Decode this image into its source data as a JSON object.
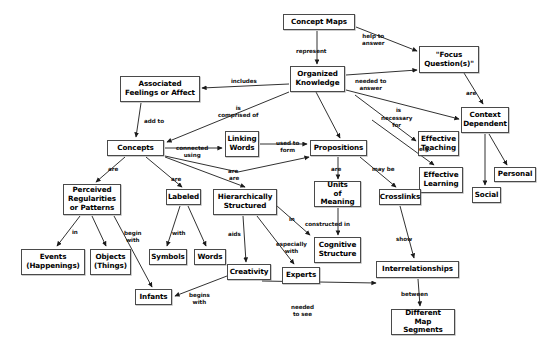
{
  "diagram": {
    "title": "Concept Maps",
    "type": "concept-map",
    "background": "#ffffff",
    "node_border_color": "#4a4a4a",
    "text_color": "#000000"
  },
  "nodes": [
    {
      "id": "concept-maps",
      "label": "Concept Maps",
      "x": 283,
      "y": 14,
      "w": 72,
      "h": 16
    },
    {
      "id": "focus-questions",
      "label": "\"Focus\nQuestion(s)\"",
      "x": 419,
      "y": 46,
      "w": 60,
      "h": 27
    },
    {
      "id": "organized-knowledge",
      "label": "Organized\nKnowledge",
      "x": 290,
      "y": 66,
      "w": 55,
      "h": 26
    },
    {
      "id": "associated-feelings",
      "label": "Associated\nFeelings or Affect",
      "x": 120,
      "y": 76,
      "w": 80,
      "h": 26
    },
    {
      "id": "context-dependent",
      "label": "Context\nDependent",
      "x": 461,
      "y": 107,
      "w": 48,
      "h": 26
    },
    {
      "id": "concepts",
      "label": "Concepts",
      "x": 107,
      "y": 140,
      "w": 57,
      "h": 16
    },
    {
      "id": "linking-words",
      "label": "Linking\nWords",
      "x": 225,
      "y": 131,
      "w": 34,
      "h": 26
    },
    {
      "id": "propositions",
      "label": "Propositions",
      "x": 310,
      "y": 140,
      "w": 57,
      "h": 16
    },
    {
      "id": "effective-teaching",
      "label": "Effective\nTeaching",
      "x": 418,
      "y": 131,
      "w": 41,
      "h": 25
    },
    {
      "id": "effective-learning",
      "label": "Effective\nLearning",
      "x": 419,
      "y": 167,
      "w": 44,
      "h": 26
    },
    {
      "id": "personal",
      "label": "Personal",
      "x": 494,
      "y": 167,
      "w": 42,
      "h": 15
    },
    {
      "id": "social",
      "label": "Social",
      "x": 472,
      "y": 187,
      "w": 29,
      "h": 16
    },
    {
      "id": "perceived-regularities",
      "label": "Perceived\nRegularities\nor Patterns",
      "x": 63,
      "y": 184,
      "w": 58,
      "h": 31
    },
    {
      "id": "labeled",
      "label": "Labeled",
      "x": 166,
      "y": 189,
      "w": 35,
      "h": 16
    },
    {
      "id": "hierarchically-structured",
      "label": "Hierarchically\nStructured",
      "x": 213,
      "y": 189,
      "w": 64,
      "h": 26
    },
    {
      "id": "units-of-meaning",
      "label": "Units\nof Meaning",
      "x": 314,
      "y": 181,
      "w": 47,
      "h": 26
    },
    {
      "id": "crosslinks",
      "label": "Crosslinks",
      "x": 379,
      "y": 189,
      "w": 42,
      "h": 16
    },
    {
      "id": "events",
      "label": "Events\n(Happenings)",
      "x": 21,
      "y": 249,
      "w": 64,
      "h": 26
    },
    {
      "id": "objects",
      "label": "Objects\n(Things)",
      "x": 90,
      "y": 249,
      "w": 41,
      "h": 26
    },
    {
      "id": "symbols",
      "label": "Symbols",
      "x": 149,
      "y": 249,
      "w": 38,
      "h": 16
    },
    {
      "id": "words",
      "label": "Words",
      "x": 194,
      "y": 249,
      "w": 32,
      "h": 16
    },
    {
      "id": "cognitive-structure",
      "label": "Cognitive\nStructure",
      "x": 314,
      "y": 237,
      "w": 47,
      "h": 26
    },
    {
      "id": "interrelationships",
      "label": "Interrelationships",
      "x": 376,
      "y": 261,
      "w": 83,
      "h": 17
    },
    {
      "id": "creativity",
      "label": "Creativity",
      "x": 227,
      "y": 264,
      "w": 44,
      "h": 16
    },
    {
      "id": "experts",
      "label": "Experts",
      "x": 282,
      "y": 267,
      "w": 38,
      "h": 17
    },
    {
      "id": "infants",
      "label": "Infants",
      "x": 135,
      "y": 289,
      "w": 37,
      "h": 16
    },
    {
      "id": "different-map-segments",
      "label": "Different\nMap Segments",
      "x": 391,
      "y": 309,
      "w": 64,
      "h": 26
    }
  ],
  "edges": [
    {
      "id": "e1",
      "from": "concept-maps",
      "to": "focus-questions",
      "label": "help to\nanswer",
      "lx": 362,
      "ly": 33,
      "points": "356,27 417,51",
      "arrow": "417,51"
    },
    {
      "id": "e2",
      "from": "concept-maps",
      "to": "organized-knowledge",
      "label": "represent",
      "lx": 296,
      "ly": 48,
      "points": "317,31 317,64",
      "arrow": "317,65"
    },
    {
      "id": "e3",
      "from": "organized-knowledge",
      "to": "focus-questions",
      "label": "needed to\nanswer",
      "lx": 355,
      "ly": 78,
      "points": "346,75 417,70",
      "arrow": "417,70"
    },
    {
      "id": "e4",
      "from": "organized-knowledge",
      "to": "associated-feelings",
      "label": "includes",
      "lx": 231,
      "ly": 78,
      "points": "289,84 202,88",
      "arrow": "201,88"
    },
    {
      "id": "e5",
      "from": "organized-knowledge",
      "to": "context-dependent",
      "label": "is",
      "lx": 396,
      "ly": 107,
      "points": "346,90 459,119",
      "arrow": "459,119"
    },
    {
      "id": "e6",
      "from": "focus-questions",
      "to": "context-dependent",
      "label": "are",
      "lx": 466,
      "ly": 90,
      "points": "464,73 483,104",
      "arrow": "483,105"
    },
    {
      "id": "e7",
      "from": "organized-knowledge",
      "to": "concepts",
      "label": "is\ncomprised of",
      "lx": 218,
      "ly": 105,
      "points": "289,92 167,142",
      "arrow": "166,142"
    },
    {
      "id": "e8",
      "from": "organized-knowledge",
      "to": "propositions",
      "label": "",
      "lx": 0,
      "ly": 0,
      "points": "316,92 340,138",
      "arrow": "340,138"
    },
    {
      "id": "e9",
      "from": "associated-feelings",
      "to": "concepts",
      "label": "add to",
      "lx": 144,
      "ly": 118,
      "points": "141,103 136,137",
      "arrow": "136,138"
    },
    {
      "id": "e10",
      "from": "concepts",
      "to": "linking-words",
      "label": "connected\nusing",
      "lx": 176,
      "ly": 145,
      "points": "165,148 222,148",
      "arrow": "223,148"
    },
    {
      "id": "e11",
      "from": "linking-words",
      "to": "propositions",
      "label": "used to\nform",
      "lx": 276,
      "ly": 140,
      "points": "260,144 307,144",
      "arrow": "308,144"
    },
    {
      "id": "e12",
      "from": "concepts",
      "to": "propositions",
      "label": "are",
      "lx": 228,
      "ly": 168,
      "points": "165,156 238,172 309,157",
      "arrow": "309,157"
    },
    {
      "id": "e13",
      "from": "organized-knowledge",
      "to": "effective-teaching",
      "label": "necessary\nfor",
      "lx": 381,
      "ly": 115,
      "points": "355,95 416,141",
      "arrow": "416,141"
    },
    {
      "id": "e14",
      "from": "organized-knowledge",
      "to": "effective-learning",
      "label": "",
      "lx": 0,
      "ly": 0,
      "points": "372,120 434,165",
      "arrow": "434,165"
    },
    {
      "id": "e15",
      "from": "context-dependent",
      "to": "social",
      "label": "e.g.",
      "lx": 419,
      "ly": 146,
      "points": "485,134 485,185",
      "arrow": "485,186"
    },
    {
      "id": "e16",
      "from": "context-dependent",
      "to": "personal",
      "label": "",
      "lx": 0,
      "ly": 0,
      "points": "489,134 507,165",
      "arrow": "507,165"
    },
    {
      "id": "e17",
      "from": "propositions",
      "to": "units-of-meaning",
      "label": "are",
      "lx": 331,
      "ly": 166,
      "points": "338,157 338,179",
      "arrow": "338,180"
    },
    {
      "id": "e18",
      "from": "propositions",
      "to": "crosslinks",
      "label": "may be",
      "lx": 372,
      "ly": 166,
      "points": "360,157 396,187",
      "arrow": "396,187"
    },
    {
      "id": "e19",
      "from": "concepts",
      "to": "perceived-regularities",
      "label": "are",
      "lx": 108,
      "ly": 166,
      "points": "125,157 96,182",
      "arrow": "96,182"
    },
    {
      "id": "e20",
      "from": "concepts",
      "to": "labeled",
      "label": "are",
      "lx": 171,
      "ly": 176,
      "points": "146,157 182,187",
      "arrow": "182,187"
    },
    {
      "id": "e21",
      "from": "concepts",
      "to": "hierarchically-structured",
      "label": "are",
      "lx": 229,
      "ly": 175,
      "points": "165,157 245,187",
      "arrow": "245,187"
    },
    {
      "id": "e22",
      "from": "perceived-regularities",
      "to": "events",
      "label": "in",
      "lx": 72,
      "ly": 229,
      "points": "80,216 57,246",
      "arrow": "57,247"
    },
    {
      "id": "e23",
      "from": "perceived-regularities",
      "to": "objects",
      "label": "",
      "lx": 0,
      "ly": 0,
      "points": "92,216 106,246",
      "arrow": "106,247"
    },
    {
      "id": "e24",
      "from": "perceived-regularities",
      "to": "infants",
      "label": "begin\nwith",
      "lx": 124,
      "ly": 230,
      "points": "114,216 152,287",
      "arrow": "152,287"
    },
    {
      "id": "e25",
      "from": "labeled",
      "to": "symbols",
      "label": "with",
      "lx": 172,
      "ly": 230,
      "points": "180,206 167,246",
      "arrow": "167,247"
    },
    {
      "id": "e26",
      "from": "labeled",
      "to": "words",
      "label": "",
      "lx": 0,
      "ly": 0,
      "points": "188,206 206,246",
      "arrow": "206,247"
    },
    {
      "id": "e27",
      "from": "hierarchically-structured",
      "to": "creativity",
      "label": "aids",
      "lx": 228,
      "ly": 231,
      "points": "243,216 246,262",
      "arrow": "246,262"
    },
    {
      "id": "e28",
      "from": "hierarchically-structured",
      "to": "experts",
      "label": "especially\nwith",
      "lx": 276,
      "ly": 241,
      "points": "257,216 294,264",
      "arrow": "294,265"
    },
    {
      "id": "e29",
      "from": "hierarchically-structured",
      "to": "cognitive-structure",
      "label": "in",
      "lx": 289,
      "ly": 216,
      "points": "277,206 310,235",
      "arrow": "311,236"
    },
    {
      "id": "e30",
      "from": "units-of-meaning",
      "to": "cognitive-structure",
      "label": "constructed in",
      "lx": 305,
      "ly": 221,
      "points": "338,208 338,235",
      "arrow": "338,236"
    },
    {
      "id": "e31",
      "from": "crosslinks",
      "to": "interrelationships",
      "label": "show",
      "lx": 396,
      "ly": 236,
      "points": "400,206 414,258",
      "arrow": "414,259"
    },
    {
      "id": "e32",
      "from": "creativity",
      "to": "infants",
      "label": "begins\nwith",
      "lx": 189,
      "ly": 292,
      "points": "227,276 175,296",
      "arrow": "174,296"
    },
    {
      "id": "e33",
      "from": "creativity",
      "to": "interrelationships",
      "label": "needed\nto see",
      "lx": 291,
      "ly": 304,
      "points": "262,281 376,283",
      "arrow": "377,282"
    },
    {
      "id": "e34",
      "from": "interrelationships",
      "to": "different-map-segments",
      "label": "between",
      "lx": 401,
      "ly": 291,
      "points": "418,279 420,306",
      "arrow": "420,307"
    }
  ]
}
